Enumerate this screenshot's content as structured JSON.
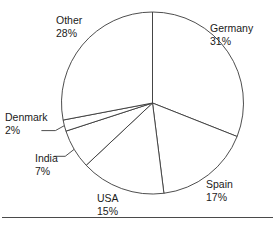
{
  "chart_data": {
    "type": "pie",
    "title": "",
    "subtitle": "",
    "xlabel": "",
    "ylabel": "",
    "legend_position": "none",
    "grid": false,
    "label_format": "name + percent",
    "categories": [
      "Germany",
      "Spain",
      "USA",
      "India",
      "Denmark",
      "Other"
    ],
    "values": [
      31,
      17,
      15,
      7,
      2,
      28
    ],
    "unit": "%",
    "start_angle_deg": 0,
    "direction": "clockwise",
    "slices": [
      {
        "name": "Germany",
        "value": 31,
        "value_label": "31%",
        "start_deg": 0,
        "end_deg": 111.6,
        "label_side": "right"
      },
      {
        "name": "Spain",
        "value": 17,
        "value_label": "17%",
        "start_deg": 111.6,
        "end_deg": 172.8,
        "label_side": "right"
      },
      {
        "name": "USA",
        "value": 15,
        "value_label": "15%",
        "start_deg": 172.8,
        "end_deg": 226.8,
        "label_side": "bottom"
      },
      {
        "name": "India",
        "value": 7,
        "value_label": "7%",
        "start_deg": 226.8,
        "end_deg": 252.0,
        "label_side": "left",
        "has_leader_line": true
      },
      {
        "name": "Denmark",
        "value": 2,
        "value_label": "2%",
        "start_deg": 252.0,
        "end_deg": 259.2,
        "label_side": "left",
        "has_leader_line": true
      },
      {
        "name": "Other",
        "value": 28,
        "value_label": "28%",
        "start_deg": 259.2,
        "end_deg": 360,
        "label_side": "left"
      }
    ]
  },
  "labels": {
    "germany": {
      "name": "Germany",
      "value": "31%"
    },
    "spain": {
      "name": "Spain",
      "value": "17%"
    },
    "usa": {
      "name": "USA",
      "value": "15%"
    },
    "india": {
      "name": "India",
      "value": "7%"
    },
    "denmark": {
      "name": "Denmark",
      "value": "2%"
    },
    "other": {
      "name": "Other",
      "value": "28%"
    }
  },
  "colors": {
    "slice_fill": "#ffffff",
    "slice_stroke": "#3a3a3a",
    "text": "#1a1a1a",
    "rule": "#4a4a4a",
    "background": "#ffffff"
  },
  "geometry": {
    "center_x": 152.5,
    "center_y": 103,
    "radius": 91
  }
}
